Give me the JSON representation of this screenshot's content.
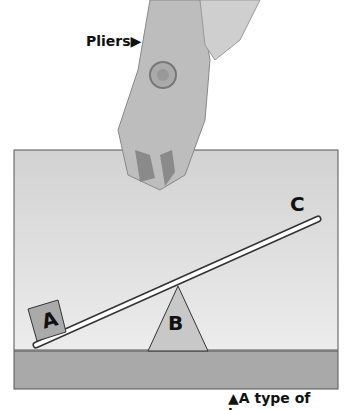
{
  "labels": {
    "pliers": "Pliers▶",
    "caption": "▲A type of lever",
    "point_a": "A",
    "point_b": "B",
    "point_c": "C"
  }
}
